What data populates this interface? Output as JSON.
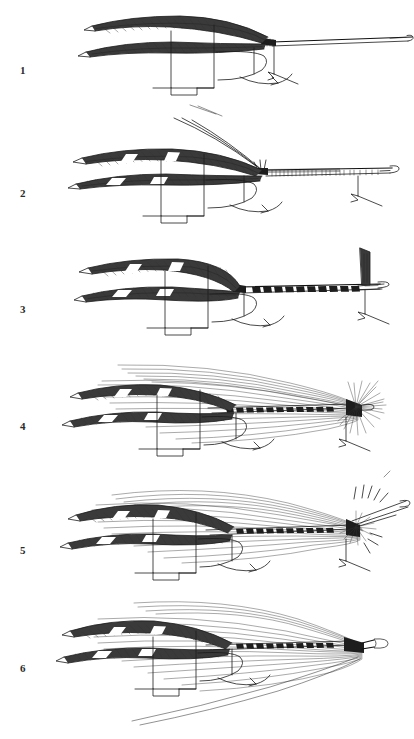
{
  "plate": {
    "title": "Fly tying stages plate",
    "description": "Six-stage black and white engraving of salmon fly construction on a hook",
    "background_color": "#ffffff",
    "ink_color": "#1c1c1c",
    "figures": [
      {
        "number": "1",
        "caption": "",
        "stage_name": "bare-hook-with-wing-feathers",
        "elements": [
          "paired-wing-feathers",
          "hook-shank",
          "hook-bend",
          "hook-point",
          "tying-thread-marker",
          "vise-jaws"
        ]
      },
      {
        "number": "2",
        "caption": "",
        "stage_name": "tail-fibres-and-ribbed-body",
        "elements": [
          "paired-wing-feathers",
          "long-feelers",
          "ribbed-body",
          "hook-shank",
          "hook-point",
          "vise-jaws"
        ]
      },
      {
        "number": "3",
        "caption": "",
        "stage_name": "segmented-body-with-upright-hackle",
        "elements": [
          "paired-wing-feathers",
          "segmented-body",
          "upright-hackle-feather",
          "hook-point",
          "vise-jaws"
        ]
      },
      {
        "number": "4",
        "caption": "",
        "stage_name": "hair-wing-and-throat-hackle",
        "elements": [
          "paired-wing-feathers",
          "long-hair-wing",
          "segmented-body",
          "throat-hackle",
          "hook-eye",
          "vise-jaws"
        ]
      },
      {
        "number": "5",
        "caption": "",
        "stage_name": "head-finishing-with-whip-tool",
        "elements": [
          "paired-wing-feathers",
          "long-hair-wing",
          "segmented-body",
          "throat-hackle",
          "whip-finish-tool",
          "vise-jaws"
        ]
      },
      {
        "number": "6",
        "caption": "",
        "stage_name": "completed-fly",
        "elements": [
          "paired-wing-feathers",
          "long-hair-wing",
          "segmented-body",
          "finished-head",
          "hook-eye",
          "vise-jaws"
        ]
      }
    ]
  }
}
